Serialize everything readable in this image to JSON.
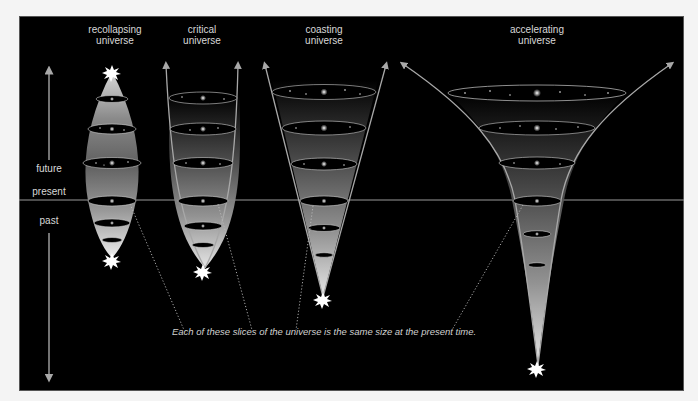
{
  "diagram": {
    "titles": {
      "recollapsing": "recollapsing universe",
      "recollapsing_line1": "recollapsing",
      "recollapsing_line2": "universe",
      "critical_line1": "critical",
      "critical_line2": "universe",
      "coasting_line1": "coasting",
      "coasting_line2": "universe",
      "accelerating_line1": "accelerating",
      "accelerating_line2": "universe"
    },
    "time_axis": {
      "future": "future",
      "present": "present",
      "past": "past"
    },
    "caption": "Each of these slices of the universe is the same size at the present time.",
    "colors": {
      "background": "#000000",
      "page": "#f4f4f4",
      "line": "#a8a8a8",
      "text": "#d8d8d8"
    },
    "models": [
      {
        "name": "recollapsing universe",
        "origin": "big bang star (bottom)",
        "end": "big crunch star (top)"
      },
      {
        "name": "critical universe",
        "origin": "big bang star (bottom)",
        "end": "open arrows (top)"
      },
      {
        "name": "coasting universe",
        "origin": "big bang star (bottom)",
        "end": "open arrows (top)"
      },
      {
        "name": "accelerating universe",
        "origin": "big bang star (bottom)",
        "end": "open arrows (top)"
      }
    ]
  }
}
